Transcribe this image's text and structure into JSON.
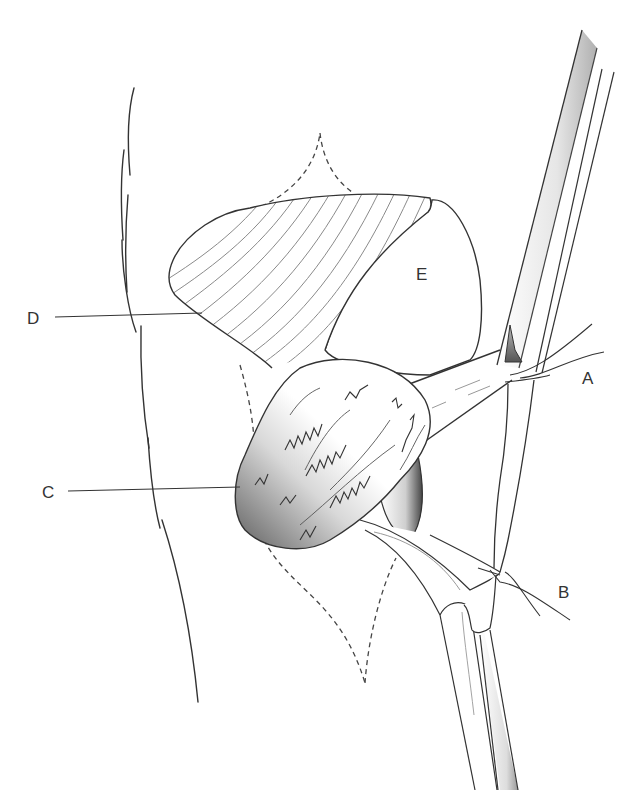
{
  "figure": {
    "type": "anatomical surgical illustration",
    "labels": [
      {
        "id": "A",
        "text": "A",
        "x": 582,
        "y": 370
      },
      {
        "id": "B",
        "text": "B",
        "x": 558,
        "y": 584
      },
      {
        "id": "C",
        "text": "C",
        "x": 42,
        "y": 484
      },
      {
        "id": "D",
        "text": "D",
        "x": 27,
        "y": 310
      },
      {
        "id": "E",
        "text": "E",
        "x": 416,
        "y": 266
      }
    ],
    "colors": {
      "line": "#333333",
      "hatch": "#8a8a8a",
      "shade_dark": "#6e6e6e",
      "shade_light": "#f4f4f4",
      "background": "#ffffff"
    }
  }
}
